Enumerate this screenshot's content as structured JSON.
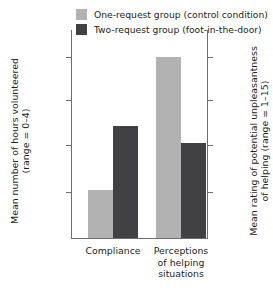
{
  "legend": {
    "items": [
      {
        "label": "One-request group (control condition)",
        "color": "#b2b2b2",
        "key": "one_request"
      },
      {
        "label": "Two-request group (foot-in-the-door)",
        "color": "#414042",
        "key": "two_request"
      }
    ]
  },
  "axes": {
    "left": {
      "title_line1": "Mean number of hours volunteered",
      "title_line2": "(range = 0–4)",
      "ticks": [
        "1.25",
        "1.00",
        "0.75",
        "0.50"
      ],
      "min": 0.3125,
      "max": 1.375
    },
    "right": {
      "title_line1": "Mean rating of potential unpleasantness",
      "title_line2": "of helping (range = 1–15)",
      "ticks": [
        "6",
        "5",
        "4",
        "3"
      ],
      "min": 1.9,
      "max": 6.3
    },
    "categories": [
      {
        "line1": "Compliance",
        "line2": "",
        "line3": ""
      },
      {
        "line1": "Perceptions",
        "line2": "of helping",
        "line3": "situations"
      }
    ]
  },
  "chart_data": {
    "type": "bar",
    "title": "",
    "xlabel": "",
    "ylabel": "Mean number of hours volunteered (range = 0–4)",
    "y2label": "Mean rating of potential unpleasantness of helping (range = 1–15)",
    "categories": [
      "Compliance",
      "Perceptions of helping situations"
    ],
    "series": [
      {
        "name": "One-request group (control condition)",
        "color": "#b2b2b2",
        "values": [
          0.53,
          1.245
        ],
        "axis": [
          "left",
          "right"
        ],
        "right_axis_values": [
          null,
          6.0
        ]
      },
      {
        "name": "Two-request group (foot-in-the-door)",
        "color": "#414042",
        "values": [
          0.885,
          0.75
        ],
        "axis": [
          "left",
          "right"
        ],
        "right_axis_values": [
          null,
          4.0
        ]
      }
    ],
    "ylim": [
      0.3125,
      1.375
    ],
    "y2lim": [
      1.9,
      6.3
    ],
    "yticks": [
      0.5,
      0.75,
      1.0,
      1.25
    ],
    "y2ticks": [
      3,
      4,
      5,
      6
    ],
    "grid": false,
    "legend_position": "top"
  },
  "geometry": {
    "bars": [
      {
        "name": "compliance-one-request",
        "series": 0,
        "group": 0,
        "left": 17,
        "width": 25,
        "top": 190
      },
      {
        "name": "compliance-two-request",
        "series": 1,
        "group": 0,
        "left": 42,
        "width": 25,
        "top": 126
      },
      {
        "name": "perceptions-one-request",
        "series": 0,
        "group": 1,
        "left": 85,
        "width": 25,
        "top": 57
      },
      {
        "name": "perceptions-two-request",
        "series": 1,
        "group": 1,
        "left": 110,
        "width": 25,
        "top": 143
      }
    ],
    "ticks_y": [
      57,
      100,
      145,
      192
    ],
    "group_centers": [
      42,
      110
    ]
  }
}
